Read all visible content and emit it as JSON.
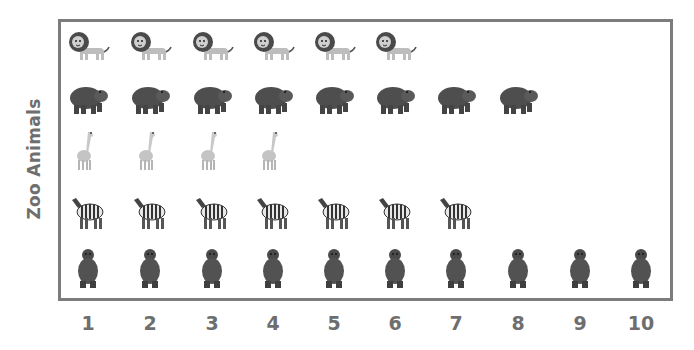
{
  "chart_data": {
    "type": "pictograph",
    "title": "",
    "ylabel": "Zoo Animals",
    "xlabel": "",
    "x_ticks": [
      "1",
      "2",
      "3",
      "4",
      "5",
      "6",
      "7",
      "8",
      "9",
      "10"
    ],
    "categories": [
      "Lion",
      "Hippo",
      "Giraffe",
      "Zebra",
      "Bear"
    ],
    "values": [
      6,
      8,
      4,
      7,
      10
    ],
    "xlim": [
      1,
      10
    ],
    "grid": false,
    "legend": "none"
  },
  "colors": {
    "frame": "#7c7c7c",
    "text": "#6e6e6e"
  }
}
